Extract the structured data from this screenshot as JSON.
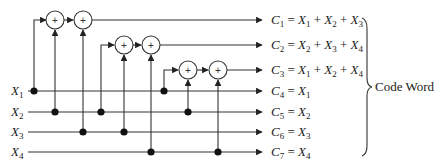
{
  "diagram": {
    "type": "hamming-encoder-circuit",
    "inputs": [
      {
        "name": "X",
        "sub": "1"
      },
      {
        "name": "X",
        "sub": "2"
      },
      {
        "name": "X",
        "sub": "3"
      },
      {
        "name": "X",
        "sub": "4"
      }
    ],
    "outputs": [
      {
        "name": "C",
        "sub": "1",
        "terms": [
          {
            "v": "X",
            "s": "1"
          },
          {
            "v": "X",
            "s": "2"
          },
          {
            "v": "X",
            "s": "3"
          }
        ]
      },
      {
        "name": "C",
        "sub": "2",
        "terms": [
          {
            "v": "X",
            "s": "2"
          },
          {
            "v": "X",
            "s": "3"
          },
          {
            "v": "X",
            "s": "4"
          }
        ]
      },
      {
        "name": "C",
        "sub": "3",
        "terms": [
          {
            "v": "X",
            "s": "1"
          },
          {
            "v": "X",
            "s": "2"
          },
          {
            "v": "X",
            "s": "4"
          }
        ]
      },
      {
        "name": "C",
        "sub": "4",
        "terms": [
          {
            "v": "X",
            "s": "1"
          }
        ]
      },
      {
        "name": "C",
        "sub": "5",
        "terms": [
          {
            "v": "X",
            "s": "2"
          }
        ]
      },
      {
        "name": "C",
        "sub": "6",
        "terms": [
          {
            "v": "X",
            "s": "3"
          }
        ]
      },
      {
        "name": "C",
        "sub": "7",
        "terms": [
          {
            "v": "X",
            "s": "4"
          }
        ]
      }
    ],
    "adder_symbol": "+",
    "equals": "=",
    "plus": "+",
    "brace_label": "Code Word"
  }
}
